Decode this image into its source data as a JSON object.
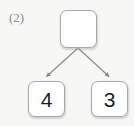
{
  "label": {
    "text": "(2)"
  },
  "diagram": {
    "type": "number-bond-tree",
    "nodes": [
      {
        "id": "top",
        "value": "",
        "empty": true
      },
      {
        "id": "left",
        "value": "4",
        "empty": false
      },
      {
        "id": "right",
        "value": "3",
        "empty": false
      }
    ],
    "edges": [
      {
        "from": "top",
        "to": "left",
        "arrow": true
      },
      {
        "from": "top",
        "to": "right",
        "arrow": true
      }
    ]
  },
  "colors": {
    "background": "#f7f7f5",
    "box_fill": "#ffffff",
    "box_border": "#a8a8a8",
    "connector": "#8a8a8a",
    "label_text": "#8d8d8d",
    "value_text": "#1c1c1c"
  }
}
